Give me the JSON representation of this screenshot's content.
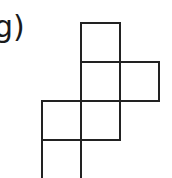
{
  "figure": {
    "label": "g)",
    "stroke_color": "#222222",
    "cells": [
      {
        "col": 1,
        "row": 0
      },
      {
        "col": 1,
        "row": 1
      },
      {
        "col": 2,
        "row": 1
      },
      {
        "col": 0,
        "row": 2
      },
      {
        "col": 1,
        "row": 2
      },
      {
        "col": 0,
        "row": 3
      }
    ]
  }
}
